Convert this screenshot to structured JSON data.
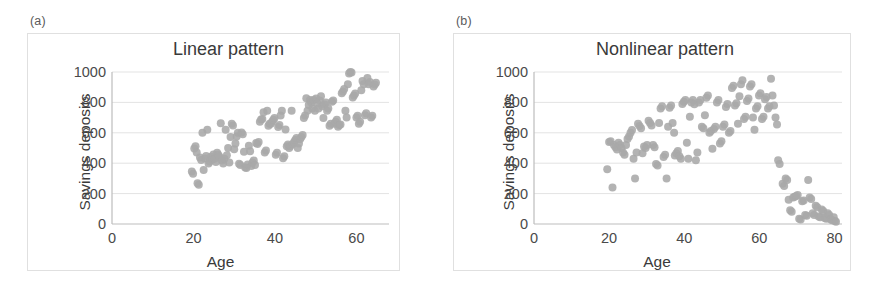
{
  "figure": {
    "background": "#ffffff",
    "panel_border_color": "#e0e0e0"
  },
  "panels": [
    {
      "tag": "(a)",
      "title": "Linear pattern",
      "xlabel": "Age",
      "ylabel": "Savings deposits"
    },
    {
      "tag": "(b)",
      "title": "Nonlinear pattern",
      "xlabel": "Age",
      "ylabel": "Savings deposits"
    }
  ],
  "chart_data": [
    {
      "type": "scatter",
      "title": "Linear pattern",
      "xlabel": "Age",
      "ylabel": "Savings deposits",
      "xlim": [
        0,
        68
      ],
      "ylim": [
        0,
        1000
      ],
      "xticks": [
        0,
        20,
        40,
        60
      ],
      "yticks": [
        0,
        200,
        400,
        600,
        800,
        1000
      ],
      "grid": "horizontal",
      "marker_color": "#a9a9a9",
      "marker_size": 8,
      "legend": null,
      "points": [
        [
          19.6,
          345
        ],
        [
          19.9,
          330
        ],
        [
          20.2,
          497
        ],
        [
          20.5,
          512
        ],
        [
          20.8,
          470
        ],
        [
          21.0,
          268
        ],
        [
          21.3,
          258
        ],
        [
          21.6,
          437
        ],
        [
          21.9,
          421
        ],
        [
          22.2,
          600
        ],
        [
          22.5,
          356
        ],
        [
          22.8,
          431
        ],
        [
          23.1,
          448
        ],
        [
          23.4,
          620
        ],
        [
          23.7,
          398
        ],
        [
          24.0,
          412
        ],
        [
          24.3,
          442
        ],
        [
          24.6,
          424
        ],
        [
          24.9,
          458
        ],
        [
          25.2,
          430
        ],
        [
          25.5,
          408
        ],
        [
          25.8,
          469
        ],
        [
          26.1,
          455
        ],
        [
          26.4,
          442
        ],
        [
          26.7,
          663
        ],
        [
          27.0,
          418
        ],
        [
          27.3,
          398
        ],
        [
          27.6,
          430
        ],
        [
          27.9,
          620
        ],
        [
          28.2,
          452
        ],
        [
          28.5,
          500
        ],
        [
          28.8,
          405
        ],
        [
          29.1,
          572
        ],
        [
          29.4,
          660
        ],
        [
          29.7,
          648
        ],
        [
          30.0,
          492
        ],
        [
          30.3,
          530
        ],
        [
          30.6,
          575
        ],
        [
          30.9,
          600
        ],
        [
          31.2,
          396
        ],
        [
          31.5,
          388
        ],
        [
          31.8,
          602
        ],
        [
          32.1,
          590
        ],
        [
          32.4,
          475
        ],
        [
          32.7,
          372
        ],
        [
          33.0,
          368
        ],
        [
          33.3,
          392
        ],
        [
          33.6,
          515
        ],
        [
          33.9,
          478
        ],
        [
          34.2,
          381
        ],
        [
          34.5,
          404
        ],
        [
          34.8,
          418
        ],
        [
          35.1,
          388
        ],
        [
          35.4,
          533
        ],
        [
          35.7,
          527
        ],
        [
          36.0,
          540
        ],
        [
          36.3,
          672
        ],
        [
          36.6,
          688
        ],
        [
          36.9,
          690
        ],
        [
          37.2,
          735
        ],
        [
          37.5,
          470
        ],
        [
          37.8,
          483
        ],
        [
          38.1,
          745
        ],
        [
          38.4,
          646
        ],
        [
          38.7,
          660
        ],
        [
          39.0,
          659
        ],
        [
          39.3,
          673
        ],
        [
          39.6,
          686
        ],
        [
          39.9,
          698
        ],
        [
          40.2,
          456
        ],
        [
          40.5,
          469
        ],
        [
          40.8,
          638
        ],
        [
          41.1,
          651
        ],
        [
          41.4,
          713
        ],
        [
          41.7,
          745
        ],
        [
          42.0,
          432
        ],
        [
          42.3,
          446
        ],
        [
          42.6,
          622
        ],
        [
          42.9,
          511
        ],
        [
          43.2,
          523
        ],
        [
          43.5,
          500
        ],
        [
          43.8,
          513
        ],
        [
          44.1,
          745
        ],
        [
          44.4,
          527
        ],
        [
          44.7,
          540
        ],
        [
          45.0,
          553
        ],
        [
          45.3,
          566
        ],
        [
          45.6,
          500
        ],
        [
          45.9,
          530
        ],
        [
          46.2,
          560
        ],
        [
          46.5,
          573
        ],
        [
          46.8,
          586
        ],
        [
          47.1,
          698
        ],
        [
          47.4,
          713
        ],
        [
          47.7,
          828
        ],
        [
          48.0,
          745
        ],
        [
          48.3,
          783
        ],
        [
          48.6,
          815
        ],
        [
          48.9,
          800
        ],
        [
          49.2,
          760
        ],
        [
          49.5,
          816
        ],
        [
          49.8,
          745
        ],
        [
          50.1,
          825
        ],
        [
          50.4,
          792
        ],
        [
          50.7,
          760
        ],
        [
          51.0,
          812
        ],
        [
          51.3,
          840
        ],
        [
          51.6,
          775
        ],
        [
          51.9,
          698
        ],
        [
          52.2,
          786
        ],
        [
          52.5,
          800
        ],
        [
          52.8,
          745
        ],
        [
          53.1,
          760
        ],
        [
          53.4,
          646
        ],
        [
          53.7,
          660
        ],
        [
          54.0,
          805
        ],
        [
          54.3,
          812
        ],
        [
          54.6,
          660
        ],
        [
          54.9,
          673
        ],
        [
          55.2,
          686
        ],
        [
          55.5,
          640
        ],
        [
          55.8,
          652
        ],
        [
          56.1,
          655
        ],
        [
          56.4,
          860
        ],
        [
          56.7,
          872
        ],
        [
          57.0,
          888
        ],
        [
          57.3,
          745
        ],
        [
          57.6,
          700
        ],
        [
          57.9,
          920
        ],
        [
          58.2,
          990
        ],
        [
          58.5,
          1000
        ],
        [
          58.8,
          996
        ],
        [
          59.1,
          832
        ],
        [
          59.4,
          845
        ],
        [
          59.7,
          858
        ],
        [
          60.0,
          700
        ],
        [
          60.3,
          712
        ],
        [
          60.6,
          660
        ],
        [
          60.9,
          672
        ],
        [
          61.2,
          880
        ],
        [
          61.5,
          940
        ],
        [
          61.8,
          920
        ],
        [
          62.1,
          716
        ],
        [
          62.4,
          728
        ],
        [
          62.7,
          960
        ],
        [
          63.0,
          920
        ],
        [
          63.3,
          935
        ],
        [
          63.6,
          700
        ],
        [
          63.9,
          712
        ],
        [
          64.2,
          905
        ],
        [
          64.5,
          918
        ],
        [
          64.8,
          930
        ]
      ]
    },
    {
      "type": "scatter",
      "title": "Nonlinear pattern",
      "xlabel": "Age",
      "ylabel": "Savings deposits",
      "xlim": [
        0,
        82
      ],
      "ylim": [
        0,
        1000
      ],
      "xticks": [
        0,
        20,
        40,
        60,
        80
      ],
      "yticks": [
        0,
        200,
        400,
        600,
        800,
        1000
      ],
      "grid": "horizontal",
      "marker_color": "#a9a9a9",
      "marker_size": 8,
      "legend": null,
      "points": [
        [
          19.5,
          360
        ],
        [
          20.0,
          540
        ],
        [
          20.4,
          545
        ],
        [
          20.9,
          240
        ],
        [
          21.3,
          520
        ],
        [
          21.7,
          505
        ],
        [
          22.1,
          490
        ],
        [
          22.5,
          535
        ],
        [
          22.9,
          520
        ],
        [
          23.3,
          500
        ],
        [
          23.7,
          470
        ],
        [
          24.1,
          455
        ],
        [
          24.5,
          520
        ],
        [
          24.9,
          560
        ],
        [
          25.3,
          575
        ],
        [
          25.7,
          600
        ],
        [
          26.1,
          618
        ],
        [
          26.5,
          430
        ],
        [
          26.9,
          300
        ],
        [
          27.3,
          470
        ],
        [
          27.7,
          660
        ],
        [
          28.1,
          645
        ],
        [
          28.5,
          630
        ],
        [
          28.9,
          465
        ],
        [
          29.3,
          510
        ],
        [
          29.7,
          500
        ],
        [
          30.1,
          520
        ],
        [
          30.5,
          680
        ],
        [
          30.9,
          665
        ],
        [
          31.3,
          648
        ],
        [
          31.7,
          520
        ],
        [
          32.1,
          505
        ],
        [
          32.5,
          395
        ],
        [
          32.9,
          385
        ],
        [
          33.3,
          665
        ],
        [
          33.7,
          760
        ],
        [
          34.1,
          775
        ],
        [
          34.5,
          440
        ],
        [
          34.9,
          455
        ],
        [
          35.3,
          300
        ],
        [
          35.7,
          640
        ],
        [
          36.1,
          765
        ],
        [
          36.5,
          780
        ],
        [
          36.9,
          665
        ],
        [
          37.3,
          600
        ],
        [
          37.5,
          450
        ],
        [
          37.9,
          465
        ],
        [
          38.3,
          480
        ],
        [
          38.7,
          445
        ],
        [
          39.1,
          430
        ],
        [
          39.5,
          790
        ],
        [
          39.9,
          805
        ],
        [
          40.3,
          815
        ],
        [
          40.7,
          535
        ],
        [
          41.1,
          430
        ],
        [
          41.5,
          705
        ],
        [
          41.9,
          800
        ],
        [
          42.3,
          815
        ],
        [
          42.7,
          788
        ],
        [
          43.1,
          420
        ],
        [
          43.5,
          470
        ],
        [
          43.9,
          800
        ],
        [
          44.3,
          815
        ],
        [
          44.7,
          640
        ],
        [
          45.1,
          630
        ],
        [
          45.5,
          715
        ],
        [
          45.9,
          830
        ],
        [
          46.3,
          845
        ],
        [
          46.7,
          600
        ],
        [
          47.1,
          612
        ],
        [
          47.5,
          495
        ],
        [
          47.9,
          625
        ],
        [
          48.3,
          640
        ],
        [
          48.7,
          800
        ],
        [
          49.1,
          815
        ],
        [
          49.5,
          530
        ],
        [
          49.9,
          545
        ],
        [
          50.3,
          640
        ],
        [
          50.7,
          655
        ],
        [
          51.1,
          770
        ],
        [
          51.5,
          790
        ],
        [
          51.9,
          600
        ],
        [
          52.3,
          612
        ],
        [
          52.7,
          895
        ],
        [
          53.1,
          910
        ],
        [
          53.5,
          780
        ],
        [
          53.9,
          795
        ],
        [
          54.3,
          660
        ],
        [
          54.7,
          840
        ],
        [
          55.1,
          920
        ],
        [
          55.5,
          945
        ],
        [
          55.9,
          690
        ],
        [
          56.3,
          705
        ],
        [
          56.7,
          810
        ],
        [
          57.1,
          825
        ],
        [
          57.5,
          905
        ],
        [
          57.9,
          920
        ],
        [
          58.3,
          700
        ],
        [
          58.7,
          620
        ],
        [
          59.1,
          760
        ],
        [
          59.5,
          775
        ],
        [
          59.9,
          845
        ],
        [
          60.3,
          860
        ],
        [
          60.7,
          690
        ],
        [
          61.1,
          705
        ],
        [
          61.5,
          820
        ],
        [
          61.9,
          835
        ],
        [
          62.3,
          760
        ],
        [
          62.7,
          775
        ],
        [
          63.1,
          955
        ],
        [
          63.5,
          845
        ],
        [
          63.9,
          780
        ],
        [
          64.3,
          700
        ],
        [
          64.7,
          655
        ],
        [
          65.0,
          420
        ],
        [
          65.4,
          395
        ],
        [
          66.2,
          265
        ],
        [
          66.6,
          250
        ],
        [
          67.0,
          300
        ],
        [
          67.4,
          290
        ],
        [
          67.8,
          160
        ],
        [
          68.2,
          90
        ],
        [
          68.6,
          80
        ],
        [
          69.0,
          175
        ],
        [
          69.4,
          180
        ],
        [
          69.8,
          185
        ],
        [
          70.2,
          190
        ],
        [
          70.6,
          35
        ],
        [
          71.0,
          30
        ],
        [
          71.4,
          150
        ],
        [
          71.8,
          155
        ],
        [
          72.2,
          60
        ],
        [
          72.6,
          55
        ],
        [
          73.0,
          290
        ],
        [
          73.4,
          175
        ],
        [
          73.8,
          165
        ],
        [
          74.2,
          70
        ],
        [
          74.6,
          60
        ],
        [
          75.0,
          120
        ],
        [
          75.4,
          110
        ],
        [
          75.8,
          50
        ],
        [
          76.2,
          45
        ],
        [
          76.6,
          95
        ],
        [
          77.0,
          85
        ],
        [
          77.4,
          40
        ],
        [
          77.8,
          35
        ],
        [
          78.2,
          70
        ],
        [
          78.6,
          60
        ],
        [
          79.0,
          30
        ],
        [
          79.4,
          25
        ],
        [
          79.8,
          45
        ],
        [
          80.1,
          20
        ],
        [
          80.4,
          15
        ]
      ]
    }
  ]
}
